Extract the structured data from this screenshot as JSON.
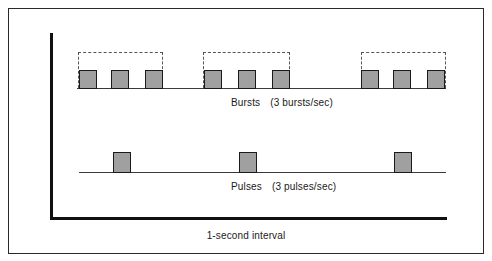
{
  "colors": {
    "background": "#ffffff",
    "frame_border": "#2a2a2a",
    "axis": "#111111",
    "baseline": "#3a3a3a",
    "square_fill": "#a0a0a0",
    "square_border": "#1a1a1a",
    "dashed_box": "#555555",
    "text": "#1a1a1a"
  },
  "bursts": {
    "label": "Bursts",
    "rate": "(3 bursts/sec)",
    "rate_value": 3,
    "baseline_y": 88,
    "baseline_x1": 77,
    "baseline_x2": 446,
    "square_top": 70,
    "square_size": 18,
    "pulses_per_burst": 3,
    "groups": [
      {
        "box_x1": 78,
        "box_x2": 163,
        "box_top": 52,
        "squares_x": [
          79,
          111,
          145
        ]
      },
      {
        "box_x1": 203,
        "box_x2": 290,
        "box_top": 52,
        "squares_x": [
          204,
          238,
          272
        ]
      },
      {
        "box_x1": 361,
        "box_x2": 446,
        "box_top": 52,
        "squares_x": [
          361,
          393,
          427
        ]
      }
    ]
  },
  "pulses": {
    "label": "Pulses",
    "rate": "(3 pulses/sec)",
    "rate_value": 3,
    "baseline_y": 172,
    "baseline_x1": 79,
    "baseline_x2": 446,
    "square_top": 152,
    "square_size": 18,
    "squares_x": [
      113,
      239,
      394
    ]
  },
  "axis_label": "1-second interval"
}
